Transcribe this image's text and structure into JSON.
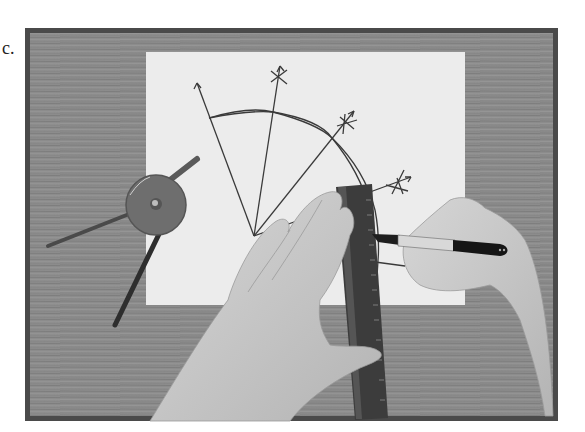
{
  "figure": {
    "label": "c.",
    "colors": {
      "frame": "#4a4a4a",
      "table": "#8a8a8a",
      "paper": "#ececec",
      "ink": "#3a3a3a",
      "skin": "#c8c8c8",
      "ruler": "#3c3c3c",
      "compass": "#6e6e6e"
    },
    "objects": [
      "compass",
      "paper",
      "ruler",
      "left-hand",
      "right-hand",
      "marker",
      "construction-lines",
      "arc"
    ]
  }
}
